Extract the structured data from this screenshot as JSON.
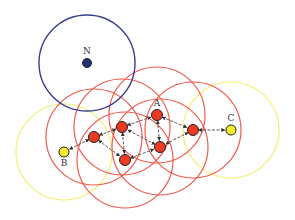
{
  "colors": {
    "background": "#ffffff",
    "range_blue": "#3a3f8f",
    "range_red": "#f05a4a",
    "range_yellow": "#f5ef70",
    "node_red": "#ee3a22",
    "node_yellow": "#f4ec2a",
    "node_blue": "#22307a",
    "edge": "#333333"
  },
  "range_radius": 48,
  "nodes": [
    {
      "id": "N",
      "label": "N",
      "x": 87,
      "y": 63,
      "type": "isolated"
    },
    {
      "id": "B",
      "label": "B",
      "x": 64,
      "y": 152,
      "type": "endpoint"
    },
    {
      "id": "C",
      "label": "C",
      "x": 231,
      "y": 130,
      "type": "endpoint"
    },
    {
      "id": "A",
      "label": "A",
      "x": 157,
      "y": 115,
      "type": "relay"
    },
    {
      "id": "R1",
      "label": "",
      "x": 94,
      "y": 137,
      "type": "relay"
    },
    {
      "id": "R2",
      "label": "",
      "x": 122,
      "y": 127,
      "type": "relay"
    },
    {
      "id": "R4",
      "label": "",
      "x": 193,
      "y": 130,
      "type": "relay"
    },
    {
      "id": "R5",
      "label": "",
      "x": 160,
      "y": 147,
      "type": "relay"
    },
    {
      "id": "R6",
      "label": "",
      "x": 125,
      "y": 160,
      "type": "relay"
    }
  ],
  "edges": [
    {
      "from": "R1",
      "to": "B",
      "directed": true
    },
    {
      "from": "R1",
      "to": "R2",
      "directed": true
    },
    {
      "from": "R1",
      "to": "R6",
      "directed": true
    },
    {
      "from": "R2",
      "to": "A",
      "directed": true
    },
    {
      "from": "R2",
      "to": "R6",
      "directed": true
    },
    {
      "from": "A",
      "to": "R4",
      "directed": true
    },
    {
      "from": "A",
      "to": "R5",
      "directed": true
    },
    {
      "from": "R5",
      "to": "R2",
      "directed": true
    },
    {
      "from": "R6",
      "to": "R5",
      "directed": true
    },
    {
      "from": "R4",
      "to": "R5",
      "directed": true
    },
    {
      "from": "R4",
      "to": "C",
      "directed": true
    }
  ]
}
